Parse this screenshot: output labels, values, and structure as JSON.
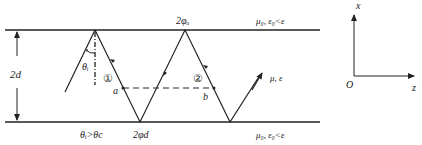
{
  "diagram": {
    "thickness_label": "2d",
    "incidence_angle_label": "θᵢ",
    "condition_label": "θᵢ>θc",
    "phase_top_label": "2φᵤ",
    "phase_bottom_label": "2φd",
    "ray1_label": "①",
    "ray2_label": "②",
    "point_a_label": "a",
    "point_b_label": "b",
    "top_medium_label": "μ₀, ε₀<ε",
    "bottom_medium_label": "μ₀, ε₀<ε",
    "core_medium_label": "μ, ε",
    "axes": {
      "x_label": "x",
      "z_label": "z",
      "origin_label": "O"
    }
  }
}
